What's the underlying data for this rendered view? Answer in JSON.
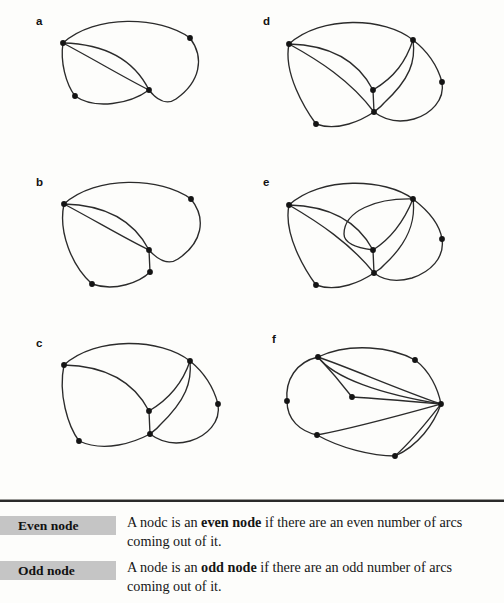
{
  "figure": {
    "graphs": [
      {
        "id": "a",
        "label": "a",
        "label_x": 36,
        "label_y": 16
      },
      {
        "id": "b",
        "label": "b",
        "label_x": 36,
        "label_y": 177
      },
      {
        "id": "c",
        "label": "c",
        "label_x": 36,
        "label_y": 338
      },
      {
        "id": "d",
        "label": "d",
        "label_x": 263,
        "label_y": 16
      },
      {
        "id": "e",
        "label": "e",
        "label_x": 263,
        "label_y": 177
      },
      {
        "id": "f",
        "label": "f",
        "label_x": 272,
        "label_y": 334
      }
    ],
    "node_color": "#141414",
    "edge_color": "#2b2b2b",
    "graph_a": {
      "nodes": [
        {
          "name": "left",
          "x": 63,
          "y": 43
        },
        {
          "name": "right",
          "x": 190,
          "y": 38
        },
        {
          "name": "center",
          "x": 149,
          "y": 90
        },
        {
          "name": "lower-left",
          "x": 75,
          "y": 96
        }
      ],
      "edges": [
        "M63,43 C95,14 160,16 190,38",
        "M190,38 C205,58 200,82 176,99 C166,106 156,99 149,90",
        "M63,43 C105,44 134,60 149,90",
        "M63,43 C95,60 125,78 149,90",
        "M63,43 C60,62 66,84 75,96",
        "M75,96 C95,110 130,104 149,90"
      ]
    },
    "graph_b": {
      "nodes": [
        {
          "name": "left",
          "x": 64,
          "y": 204
        },
        {
          "name": "right",
          "x": 191,
          "y": 199
        },
        {
          "name": "center",
          "x": 149,
          "y": 250
        },
        {
          "name": "lower-mid",
          "x": 150,
          "y": 272
        },
        {
          "name": "lower-left",
          "x": 92,
          "y": 284
        }
      ],
      "edges": [
        "M64,204 C96,175 161,177 191,199",
        "M191,199 C207,219 202,243 178,259 C168,266 157,259 149,250",
        "M64,204 C106,205 134,221 149,250",
        "M64,204 C96,221 126,239 149,250",
        "M64,204 C58,232 72,266 92,284",
        "M92,284 C115,292 140,282 150,272",
        "M149,250 L150,272"
      ]
    },
    "graph_c": {
      "nodes": [
        {
          "name": "left",
          "x": 64,
          "y": 365
        },
        {
          "name": "top-right",
          "x": 190,
          "y": 361
        },
        {
          "name": "right",
          "x": 218,
          "y": 404
        },
        {
          "name": "center",
          "x": 149,
          "y": 411
        },
        {
          "name": "lower-mid",
          "x": 150,
          "y": 434
        },
        {
          "name": "lower-left",
          "x": 79,
          "y": 441
        }
      ],
      "edges": [
        "M64,365 C96,336 161,338 190,361",
        "M190,361 C206,374 214,389 218,404",
        "M218,404 C221,422 207,436 190,441 C172,446 158,440 150,434",
        "M190,361 C183,382 171,398 149,411",
        "M190,361 C192,382 186,400 160,425 C156,430 152,432 150,434",
        "M64,365 C106,366 134,382 149,411",
        "M64,365 C58,394 68,426 79,441",
        "M79,441 C105,453 135,442 150,434",
        "M149,411 L150,434"
      ]
    },
    "graph_d": {
      "nodes": [
        {
          "name": "left",
          "x": 289,
          "y": 44
        },
        {
          "name": "top-right",
          "x": 413,
          "y": 40
        },
        {
          "name": "right",
          "x": 442,
          "y": 82
        },
        {
          "name": "center",
          "x": 373,
          "y": 90
        },
        {
          "name": "lower-mid",
          "x": 374,
          "y": 112
        },
        {
          "name": "lower-left",
          "x": 316,
          "y": 124
        }
      ],
      "edges": [
        "M289,44 C321,15 385,17 413,40",
        "M413,40 C430,53 438,68 442,82",
        "M442,82 C445,100 431,114 414,119 C396,124 382,118 374,112",
        "M413,40 C406,61 395,77 373,90",
        "M413,40 C416,61 410,79 384,103 C380,108 376,110 374,112",
        "M289,44 C330,45 358,61 373,90",
        "M289,44 C318,60 350,80 374,112",
        "M289,44 C283,73 305,109 316,124",
        "M316,124 C338,132 362,120 374,112",
        "M373,90 L374,112"
      ]
    },
    "graph_e": {
      "nodes": [
        {
          "name": "left",
          "x": 289,
          "y": 205
        },
        {
          "name": "top-right",
          "x": 413,
          "y": 199
        },
        {
          "name": "right",
          "x": 442,
          "y": 239
        },
        {
          "name": "center",
          "x": 373,
          "y": 250
        },
        {
          "name": "lower-mid",
          "x": 374,
          "y": 273
        },
        {
          "name": "lower-left",
          "x": 316,
          "y": 285
        }
      ],
      "edges": [
        "M289,205 C321,176 385,178 413,199",
        "M413,199 C430,212 440,226 442,239",
        "M442,239 C445,258 430,272 412,278 C395,283 382,279 374,273",
        "M413,199 C376,198 344,211 344,234 C344,244 358,248 373,250",
        "M413,199 C404,221 392,238 373,250",
        "M413,199 C416,222 408,243 384,265 C380,270 376,271 374,273",
        "M289,205 C331,206 358,222 373,250",
        "M289,205 C318,222 350,243 374,273",
        "M289,205 C283,234 305,270 316,285",
        "M316,285 C338,293 362,281 374,273",
        "M373,250 L374,273"
      ]
    },
    "graph_f": {
      "nodes": [
        {
          "name": "top-left",
          "x": 318,
          "y": 357
        },
        {
          "name": "top-right",
          "x": 415,
          "y": 360
        },
        {
          "name": "right",
          "x": 441,
          "y": 404
        },
        {
          "name": "left",
          "x": 287,
          "y": 401
        },
        {
          "name": "mid",
          "x": 352,
          "y": 397
        },
        {
          "name": "lower-left",
          "x": 317,
          "y": 435
        },
        {
          "name": "bottom",
          "x": 395,
          "y": 456
        }
      ],
      "edges": [
        "M318,357 C350,342 392,347 415,360",
        "M415,360 C430,371 438,389 441,404",
        "M318,357 C296,362 285,380 287,401",
        "M287,401 C287,420 300,431 317,435",
        "M317,435 C340,448 372,456 395,456",
        "M395,456 C418,446 434,424 441,404",
        "M318,357 C350,368 400,390 441,404",
        "M318,357 C332,372 345,388 352,397",
        "M352,397 C385,399 418,402 441,404",
        "M318,357 C334,378 380,394 441,404",
        "M317,435 C355,428 405,414 441,404",
        "M395,456 C415,438 430,418 441,404"
      ]
    }
  },
  "definitions": {
    "rows": [
      {
        "term": "Even node",
        "line1_pre": "A nodc is an ",
        "line1_bold": "even node",
        "line1_post": " if there are an even number of arcs",
        "line2": "coming out of it."
      },
      {
        "term": "Odd node",
        "line1_pre": "A node is an ",
        "line1_bold": "odd node",
        "line1_post": " if there are an odd number of arcs",
        "line2": "coming out of it."
      }
    ]
  }
}
